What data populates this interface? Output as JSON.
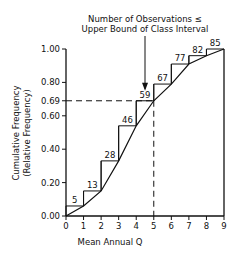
{
  "chart_data": {
    "type": "line",
    "title": "",
    "annotation": "Number of Observations ≤ Upper Bound of Class Interval",
    "annotation_line1": "Number of Observations ≤",
    "annotation_line2": "Upper Bound of Class Interval",
    "xlabel": "Mean Annual Q",
    "ylabel_line1": "Cumulative Frequency",
    "ylabel_line2": "(Relative Frequency)",
    "xlim": [
      0,
      9
    ],
    "ylim": [
      0,
      1.0
    ],
    "x_ticks": [
      "0",
      "1",
      "2",
      "3",
      "4",
      "5",
      "6",
      "7",
      "8",
      "9"
    ],
    "y_ticks": [
      "0.00",
      "0.20",
      "0.40",
      "0.60",
      "0.69",
      "0.80",
      "1.00"
    ],
    "grid": false,
    "x": [
      0,
      1,
      2,
      3,
      4,
      5,
      6,
      7,
      8,
      9
    ],
    "series": [
      {
        "name": "Cumulative count (step histogram)",
        "style": "step",
        "upper_bounds": [
          1,
          2,
          3,
          4,
          5,
          6,
          7,
          8,
          9
        ],
        "counts": [
          5,
          13,
          28,
          46,
          59,
          67,
          77,
          82,
          85
        ],
        "relative_frequency": [
          0.06,
          0.15,
          0.33,
          0.54,
          0.69,
          0.79,
          0.91,
          0.96,
          1.0
        ]
      },
      {
        "name": "Cumulative frequency curve",
        "style": "line",
        "x": [
          0,
          1,
          2,
          3,
          4,
          5,
          6,
          7,
          8,
          9
        ],
        "y": [
          0.0,
          0.06,
          0.15,
          0.33,
          0.54,
          0.69,
          0.79,
          0.91,
          0.96,
          1.0
        ]
      }
    ],
    "reference_lines": [
      {
        "type": "horizontal",
        "y": 0.69,
        "label": "0.69",
        "style": "dashed"
      },
      {
        "type": "vertical",
        "x": 5,
        "style": "dashed"
      }
    ]
  }
}
